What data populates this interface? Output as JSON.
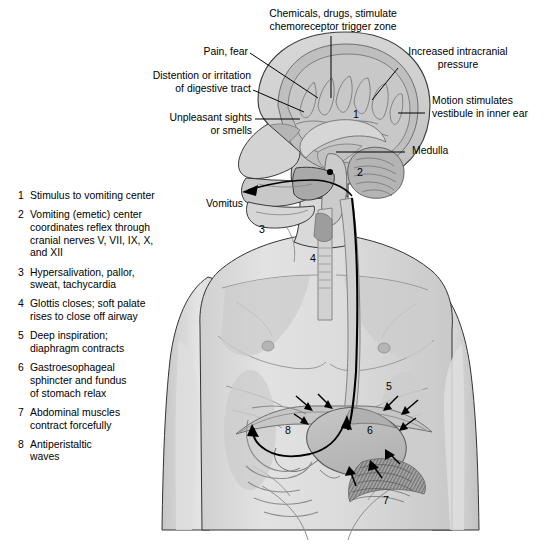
{
  "figure": {
    "background_color": "#ffffff",
    "line_color": "#1a1a1a",
    "skin_light": "#e3e3e3",
    "skin_mid": "#cfcfcf",
    "skin_shadow": "#b9b9b9",
    "organ_fill": "#bdbdbd",
    "brain_fill": "#c4c4c4",
    "muscle_fill": "#8f8f8f"
  },
  "callouts": [
    {
      "name": "chemicals-drugs",
      "text": "Chemicals, drugs, stimulate\nchemoreceptor trigger zone"
    },
    {
      "name": "pain-fear",
      "text": "Pain, fear"
    },
    {
      "name": "increased-intracranial-pressure",
      "text": "Increased intracranial\npressure"
    },
    {
      "name": "distention-irritation",
      "text": "Distention or irritation\nof  digestive tract"
    },
    {
      "name": "motion-stimulates-vestibule",
      "text": "Motion stimulates\nvestibule in inner ear"
    },
    {
      "name": "unpleasant-sights",
      "text": "Unpleasant sights\nor smells"
    },
    {
      "name": "medulla",
      "text": "Medulla"
    },
    {
      "name": "vomitus",
      "text": "Vomitus"
    }
  ],
  "legend": {
    "items": [
      {
        "num": "1",
        "text": "Stimulus to vomiting center"
      },
      {
        "num": "2",
        "text": "Vomiting (emetic) center\ncoordinates reflex through\ncranial nerves V, VII, IX, X,\nand XII"
      },
      {
        "num": "3",
        "text": "Hypersalivation, pallor,\nsweat, tachycardia"
      },
      {
        "num": "4",
        "text": "Glottis closes; soft palate\nrises to close off airway"
      },
      {
        "num": "5",
        "text": "Deep inspiration;\ndiaphragm contracts"
      },
      {
        "num": "6",
        "text": "Gastroesophageal\nsphincter and fundus\nof stomach relax"
      },
      {
        "num": "7",
        "text": "Abdominal muscles\ncontract forcefully"
      },
      {
        "num": "8",
        "text": "Antiperistaltic\nwaves"
      }
    ]
  },
  "markers": [
    {
      "name": "marker-1-brain",
      "label": "1"
    },
    {
      "name": "marker-2-medulla",
      "label": "2"
    },
    {
      "name": "marker-3-neck",
      "label": "3"
    },
    {
      "name": "marker-4-glottis",
      "label": "4"
    },
    {
      "name": "marker-5-diaphragm",
      "label": "5"
    },
    {
      "name": "marker-6-stomach",
      "label": "6"
    },
    {
      "name": "marker-7-abdominal",
      "label": "7"
    },
    {
      "name": "marker-8-intestine",
      "label": "8"
    }
  ]
}
